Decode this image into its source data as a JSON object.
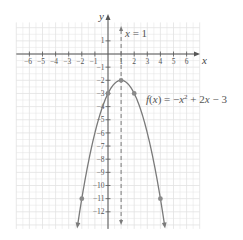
{
  "chart_data": {
    "type": "line",
    "title": "",
    "function_label": "f(x) = −x² + 2x − 3",
    "function_label_parts": {
      "f": "f",
      "open": "(",
      "x": "x",
      "close_eq": ") = −",
      "x2": "x",
      "sup": "2",
      "rest": " + 2",
      "x3": "x",
      "tail": " − 3"
    },
    "axis_of_symmetry_label": "x = 1",
    "axis_of_symmetry": {
      "x": 1,
      "style": "dashed"
    },
    "xlabel": "x",
    "ylabel": "y",
    "xlim": [
      -7,
      7
    ],
    "ylim": [
      -13.3,
      2.4
    ],
    "grid": true,
    "x_ticks": [
      -6,
      -5,
      -4,
      -3,
      -2,
      -1,
      1,
      2,
      3,
      4,
      5,
      6
    ],
    "x_tick_labels": [
      "−6",
      "−5",
      "−4",
      "−3",
      "−2",
      "−1",
      "1",
      "2",
      "3",
      "4",
      "5",
      "6"
    ],
    "y_ticks": [
      1,
      -1,
      -2,
      -3,
      -4,
      -5,
      -6,
      -7,
      -8,
      -9,
      -10,
      -11,
      -12
    ],
    "y_tick_labels": [
      "1",
      "−1",
      "−2",
      "−3",
      "−4",
      "−5",
      "−6",
      "−7",
      "−8",
      "−9",
      "−10",
      "−11",
      "−12"
    ],
    "series": [
      {
        "name": "f(x) = −x² + 2x − 3",
        "expression": "-x^2 + 2x - 3",
        "marked_points": [
          {
            "x": -2,
            "y": -11
          },
          {
            "x": 0,
            "y": -3
          },
          {
            "x": 1,
            "y": -2
          },
          {
            "x": 2,
            "y": -3
          },
          {
            "x": 4,
            "y": -11
          }
        ],
        "vertex": {
          "x": 1,
          "y": -2
        },
        "opens": "down",
        "arrows_at_ends": true
      }
    ],
    "colors": {
      "curve": "#7a7a7a",
      "grid": "#e2e2e2",
      "axes": "#555555",
      "points": "#8a8a8a"
    }
  }
}
